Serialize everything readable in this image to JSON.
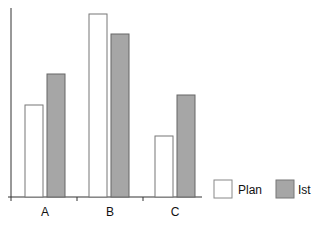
{
  "chart_data": {
    "type": "bar",
    "title": "",
    "xlabel": "",
    "ylabel": "",
    "categories": [
      "A",
      "B",
      "C"
    ],
    "series": [
      {
        "name": "Plan",
        "color": "#ffffff",
        "values": [
          92,
          183,
          61
        ]
      },
      {
        "name": "Ist",
        "color": "#a6a6a6",
        "values": [
          123,
          163,
          102
        ]
      }
    ],
    "ylim": [
      0,
      189
    ],
    "y_ticks_labeled": false,
    "grid": false,
    "legend_position": "bottom-right"
  },
  "legend": {
    "plan_label": "Plan",
    "ist_label": "Ist"
  },
  "axis": {
    "cat_a": "A",
    "cat_b": "B",
    "cat_c": "C"
  }
}
